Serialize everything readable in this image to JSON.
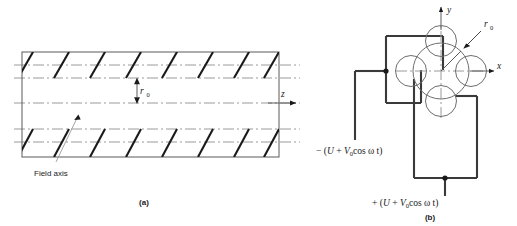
{
  "figure": {
    "panels": [
      {
        "id": "a",
        "label": "(a)",
        "caption_label": "Field axis",
        "radius_label": "r",
        "radius_sub": "0",
        "axis_label": "z"
      },
      {
        "id": "b",
        "label": "(b)",
        "radius_label": "r",
        "radius_sub": "0",
        "axis_x_label": "x",
        "axis_y_label": "y",
        "voltage_negative": {
          "sign": "− (",
          "dc": "U",
          "plus": " + ",
          "amp": "V",
          "amp_sub": "0",
          "rf": "cos ω t",
          "close": ")",
          "full": "− (U + V0cos ω t)"
        },
        "voltage_positive": {
          "sign": "+ (",
          "dc": "U",
          "plus": " + ",
          "amp": "V",
          "amp_sub": "0",
          "rf": "cos ω t",
          "close": ")",
          "full": "+ (U + V0cos ω t)"
        }
      }
    ],
    "colors": {
      "ink": "#1a1a1a",
      "rule": "#5a5a5a",
      "field": "#9a9a9a",
      "rod": "#6e6e6e",
      "background": "#ffffff"
    }
  }
}
